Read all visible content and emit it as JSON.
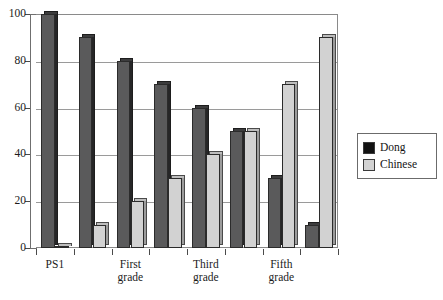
{
  "chart_data": {
    "type": "bar",
    "title": "",
    "xlabel": "",
    "ylabel": "",
    "ylim": [
      0,
      100
    ],
    "yticks": [
      0,
      20,
      40,
      60,
      80,
      100
    ],
    "grid": true,
    "legend_position": "right",
    "categories": [
      "PS1",
      "",
      "First grade",
      "",
      "Third grade",
      "",
      "Fifth grade",
      ""
    ],
    "tick_labels": [
      {
        "index": 0,
        "lines": [
          "PS1"
        ]
      },
      {
        "index": 2,
        "lines": [
          "First",
          "grade"
        ]
      },
      {
        "index": 4,
        "lines": [
          "Third",
          "grade"
        ]
      },
      {
        "index": 6,
        "lines": [
          "Fifth",
          "grade"
        ]
      }
    ],
    "series": [
      {
        "name": "Dong",
        "color": "#5a5a5b",
        "values": [
          100,
          90,
          80,
          70,
          60,
          50,
          30,
          10
        ]
      },
      {
        "name": "Chinese",
        "color": "#d2d2d2",
        "values": [
          1,
          10,
          20,
          30,
          40,
          50,
          70,
          90
        ]
      }
    ]
  },
  "axis": {
    "y_tick_labels": [
      "100",
      "80",
      "60",
      "40",
      "20",
      "0"
    ]
  },
  "legend": {
    "items": [
      {
        "label": "Dong",
        "swatch": "dark-swatch-icon"
      },
      {
        "label": "Chinese",
        "swatch": "light-swatch-icon"
      }
    ]
  }
}
